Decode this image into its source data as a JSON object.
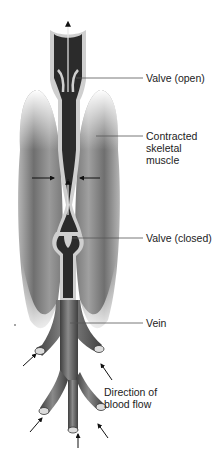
{
  "figure": {
    "labels": {
      "valve_open": "Valve (open)",
      "contracted_muscle": "Contracted\nskeletal\nmuscle",
      "valve_closed": "Valve (closed)",
      "vein": "Vein",
      "direction": "Direction of\nblood flow"
    },
    "colors": {
      "blood": "#2b2b2b",
      "vein_wall": "#cfcfcf",
      "muscle": "#8a8a8a",
      "vein_outer": "#6e6e6e",
      "arrow": "#111111",
      "leader_line": "#555555"
    }
  }
}
